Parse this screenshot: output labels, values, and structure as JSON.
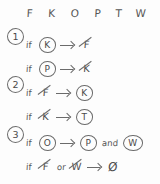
{
  "diagram": {
    "background_color": "#fdfdfd",
    "ink_color": "#4a4a4a",
    "header": {
      "letters": [
        "F",
        "K",
        "O",
        "P",
        "T",
        "W"
      ],
      "positions_px": [
        30,
        52,
        75,
        98,
        119,
        141
      ]
    },
    "groups": [
      {
        "number": "1",
        "top_px": 28,
        "lines": [
          {
            "if_label": "if",
            "tokens": [
              {
                "kind": "circled",
                "text": "K"
              },
              {
                "kind": "arrow",
                "text": "→"
              },
              {
                "kind": "struck",
                "text": "F"
              }
            ]
          },
          {
            "if_label": "if",
            "tokens": [
              {
                "kind": "circled",
                "text": "P"
              },
              {
                "kind": "arrow",
                "text": "→"
              },
              {
                "kind": "struck",
                "text": "K"
              }
            ]
          }
        ]
      },
      {
        "number": "2",
        "top_px": 76,
        "lines": [
          {
            "if_label": "if",
            "tokens": [
              {
                "kind": "struck",
                "text": "F"
              },
              {
                "kind": "arrow",
                "text": "→"
              },
              {
                "kind": "circled",
                "text": "K"
              }
            ]
          },
          {
            "if_label": "if",
            "tokens": [
              {
                "kind": "struck",
                "text": "K"
              },
              {
                "kind": "arrow",
                "text": "→"
              },
              {
                "kind": "circled",
                "text": "T"
              }
            ]
          }
        ]
      },
      {
        "number": "3",
        "top_px": 126,
        "lines": [
          {
            "if_label": "if",
            "tokens": [
              {
                "kind": "circled",
                "text": "O"
              },
              {
                "kind": "arrow",
                "text": "→"
              },
              {
                "kind": "circled",
                "text": "P"
              },
              {
                "kind": "join",
                "text": "and"
              },
              {
                "kind": "circled-wide",
                "text": "W"
              }
            ]
          },
          {
            "if_label": "if",
            "tokens": [
              {
                "kind": "struck",
                "text": "F"
              },
              {
                "kind": "join",
                "text": "or"
              },
              {
                "kind": "struck",
                "text": "W"
              },
              {
                "kind": "arrow",
                "text": "→"
              },
              {
                "kind": "plain",
                "text": "Ø"
              }
            ]
          }
        ]
      }
    ]
  }
}
